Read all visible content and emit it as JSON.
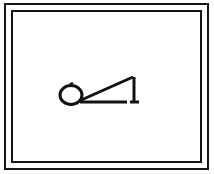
{
  "image": {
    "title": "Framed minimalist line drawing",
    "width": 214,
    "height": 174,
    "background_color": "#ffffff",
    "ink_color": "#111111"
  },
  "frame": {
    "label": "Double rectangular border",
    "outer": {
      "x": 5,
      "y": 4,
      "width": 203,
      "height": 165,
      "stroke_width": 2,
      "color": "#151515"
    },
    "inner": {
      "x": 12,
      "y": 11,
      "width": 189,
      "height": 151,
      "stroke_width": 2,
      "color": "#151515"
    }
  },
  "drawing": {
    "label": "Reclining stick figure",
    "description": "Oval head at left joined to a long horizontal body line, with a diagonal rising to a peak and a vertical leg dropping down at the right",
    "stroke_color": "#111111",
    "parts": {
      "head": {
        "name": "oval head",
        "cx": 71,
        "cy": 95,
        "rx": 11,
        "ry": 9.5,
        "stroke_width": 3
      },
      "head_notch": {
        "name": "top notch tick",
        "points": "70,85 73,83",
        "stroke_width": 3
      },
      "body": {
        "name": "horizontal body line",
        "x1": 80,
        "y1": 102,
        "x2": 127,
        "y2": 102,
        "stroke_width": 3
      },
      "diagonal": {
        "name": "diagonal back line",
        "x1": 79,
        "y1": 101,
        "x2": 133,
        "y2": 77,
        "stroke_width": 3
      },
      "peak": {
        "name": "apex corner",
        "x": 133,
        "y": 77,
        "stroke_width": 3
      },
      "leg": {
        "name": "vertical leg line",
        "x1": 134,
        "y1": 77,
        "x2": 134,
        "y2": 103,
        "stroke_width": 3
      },
      "foot": {
        "name": "foot tip",
        "x1": 130,
        "y1": 102,
        "x2": 139,
        "y2": 102,
        "stroke_width": 3
      }
    }
  }
}
